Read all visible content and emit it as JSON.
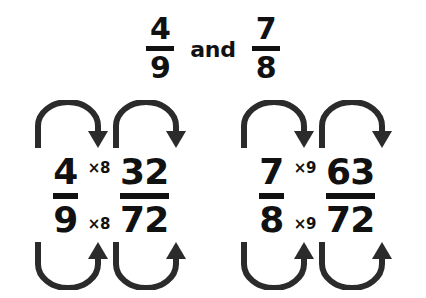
{
  "header": {
    "fraction_a": {
      "numerator": "4",
      "denominator": "9"
    },
    "conjunction": "and",
    "fraction_b": {
      "numerator": "7",
      "denominator": "8"
    }
  },
  "colors": {
    "background": "#ffffff",
    "text": "#111111",
    "arrow": "#2b2b2b"
  },
  "diagrams": [
    {
      "id": "left",
      "source": {
        "numerator": "4",
        "denominator": "9"
      },
      "multiplier_numerator": "×8",
      "multiplier_denominator": "×8",
      "result": {
        "numerator": "32",
        "denominator": "72"
      }
    },
    {
      "id": "right",
      "source": {
        "numerator": "7",
        "denominator": "8"
      },
      "multiplier_numerator": "×9",
      "multiplier_denominator": "×9",
      "result": {
        "numerator": "63",
        "denominator": "72"
      }
    }
  ]
}
